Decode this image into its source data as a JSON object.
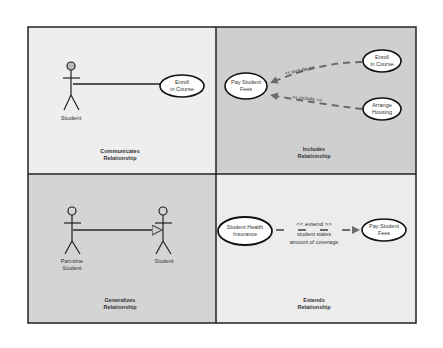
{
  "colors": {
    "page_bg": "#ffffff",
    "panel_light": "#eeeeee",
    "panel_dark": "#cfcfcf",
    "border": "#222222",
    "dashed_line": "#6b6b6b"
  },
  "panels": {
    "communicates": {
      "caption_line1": "Communicates",
      "caption_line2": "Relationship",
      "actor": {
        "label": "Student"
      },
      "use_case": {
        "line1": "Enroll",
        "line2": "in Course"
      }
    },
    "includes": {
      "caption_line1": "Includes",
      "caption_line2": "Relationship",
      "base_use_case": {
        "line1": "Pay Student",
        "line2": "Fees"
      },
      "use_case_top": {
        "line1": "Enroll",
        "line2": "in Course"
      },
      "use_case_bottom": {
        "line1": "Arrange",
        "line2": "Housing"
      },
      "stereotype_top": "<< include >>",
      "stereotype_bottom": "<< include >>"
    },
    "generalizes": {
      "caption_line1": "Generalizes",
      "caption_line2": "Relationship",
      "child_actor": {
        "line1": "Part-time",
        "line2": "Student"
      },
      "parent_actor": {
        "label": "Student"
      }
    },
    "extends": {
      "caption_line1": "Extends",
      "caption_line2": "Relationship",
      "extension_use_case": {
        "line1": "Student Health",
        "line2": "Insurance"
      },
      "base_use_case": {
        "line1": "Pay Student",
        "line2": "Fees"
      },
      "stereotype": "<< extend >>",
      "condition_line1": "student states",
      "condition_line2": "amount of coverage"
    }
  }
}
